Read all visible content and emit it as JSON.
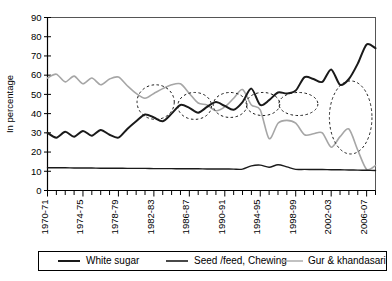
{
  "chart_data": {
    "type": "line",
    "title": "",
    "xlabel": "",
    "ylabel": "In percentage",
    "ylim": [
      0,
      90
    ],
    "ytick_step": 10,
    "yticks": [
      0,
      10,
      20,
      30,
      40,
      50,
      60,
      70,
      80,
      90
    ],
    "grid": false,
    "legend_position": "bottom",
    "x": [
      "1970-71",
      "1971-72",
      "1972-73",
      "1973-74",
      "1974-75",
      "1975-76",
      "1976-77",
      "1977-78",
      "1978-79",
      "1979-80",
      "1980-81",
      "1981-82",
      "1982-83",
      "1983-84",
      "1984-85",
      "1985-86",
      "1986-87",
      "1987-88",
      "1988-89",
      "1989-90",
      "1990-91",
      "1991-92",
      "1992-93",
      "1993-94",
      "1994-95",
      "1995-96",
      "1996-97",
      "1997-98",
      "1998-99",
      "1999-2000",
      "2000-01",
      "2001-02",
      "2002-03",
      "2003-04",
      "2004-05",
      "2005-06",
      "2006-07",
      "2007-08"
    ],
    "xtick_labels": [
      "1970-71",
      "1974-75",
      "1978-79",
      "1982-83",
      "1986-87",
      "1990-91",
      "1994-95",
      "1998-99",
      "2002-03",
      "2006-07"
    ],
    "xtick_label_indices": [
      0,
      4,
      8,
      12,
      16,
      20,
      24,
      28,
      32,
      36
    ],
    "series": [
      {
        "name": "White sugar",
        "color": "#1a1a1a",
        "width": 2.0,
        "values": [
          30,
          27.5,
          30.5,
          28,
          31,
          28.5,
          31.5,
          29,
          27.5,
          32,
          36,
          39.5,
          38,
          36,
          40,
          44.5,
          43,
          40.5,
          43.5,
          46,
          44,
          42,
          46,
          53,
          44.5,
          47,
          51,
          50.5,
          52,
          59,
          58,
          56.5,
          63,
          55,
          58,
          66,
          76,
          74
        ]
      },
      {
        "name": "Seed /feed, Chewing",
        "color": "#1a1a1a",
        "width": 1.4,
        "values": [
          11.8,
          11.8,
          11.8,
          11.7,
          11.7,
          11.7,
          11.6,
          11.6,
          11.6,
          11.5,
          11.5,
          11.5,
          11.4,
          11.4,
          11.4,
          11.3,
          11.3,
          11.3,
          11.2,
          11.2,
          11.2,
          11.1,
          11.1,
          12.8,
          13.2,
          12.1,
          13.4,
          12.3,
          11.0,
          11.0,
          10.9,
          10.9,
          10.8,
          10.8,
          10.7,
          10.6,
          10.5,
          10.4
        ]
      },
      {
        "name": "Gur & khandasari",
        "color": "#a6a6a6",
        "width": 1.6,
        "values": [
          58.5,
          60.5,
          56.5,
          59.5,
          55.5,
          58.5,
          55,
          58,
          59,
          54.5,
          50.5,
          48,
          50.5,
          53,
          55,
          55.5,
          50.5,
          45.5,
          44.5,
          41.5,
          43.5,
          48,
          52.5,
          44.5,
          42,
          27,
          35,
          36.5,
          35,
          29,
          29.5,
          30,
          22.5,
          28,
          32,
          21,
          11,
          13
        ]
      }
    ],
    "annotations": [
      {
        "type": "ellipse",
        "label": "crossover-1982-83",
        "cx_index": 12.2,
        "cy_value": 46,
        "rx_years": 2.1,
        "ry_value": 9
      },
      {
        "type": "ellipse",
        "label": "crossover-1986-87",
        "cx_index": 16.6,
        "cy_value": 44,
        "rx_years": 1.9,
        "ry_value": 7
      },
      {
        "type": "ellipse",
        "label": "crossover-1990-91",
        "cx_index": 20.6,
        "cy_value": 44.5,
        "rx_years": 1.9,
        "ry_value": 6.5
      },
      {
        "type": "ellipse",
        "label": "crossover-1994-95",
        "cx_index": 24.3,
        "cy_value": 45,
        "rx_years": 1.9,
        "ry_value": 6
      },
      {
        "type": "ellipse",
        "label": "crossover-1998-99",
        "cx_index": 28.3,
        "cy_value": 45,
        "rx_years": 2.2,
        "ry_value": 6
      },
      {
        "type": "ellipse",
        "label": "gap-2004-07",
        "cx_index": 34.2,
        "cy_value": 38,
        "rx_years": 2.4,
        "ry_value": 19
      }
    ]
  },
  "legend": {
    "items": [
      {
        "label": "White sugar"
      },
      {
        "label": "Seed /feed, Chewing"
      },
      {
        "label": "Gur & khandasari"
      }
    ]
  }
}
